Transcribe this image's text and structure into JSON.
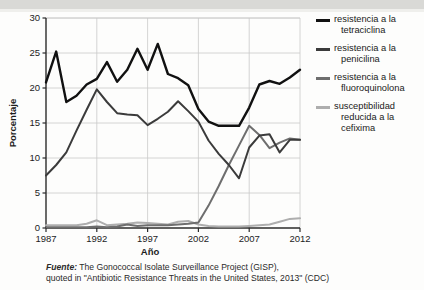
{
  "chart_data": {
    "type": "line",
    "title": "",
    "xlabel": "Año",
    "ylabel": "Porcentaje",
    "xlim": [
      1987,
      2012
    ],
    "ylim": [
      0,
      30
    ],
    "yticks": [
      0,
      5,
      10,
      15,
      20,
      25,
      30
    ],
    "xticks": [
      1987,
      1992,
      1997,
      2002,
      2007,
      2012
    ],
    "grid": true,
    "legend_position": "right",
    "x": [
      1987,
      1988,
      1989,
      1990,
      1991,
      1992,
      1993,
      1994,
      1995,
      1996,
      1997,
      1998,
      1999,
      2000,
      2001,
      2002,
      2003,
      2004,
      2005,
      2006,
      2007,
      2008,
      2009,
      2010,
      2011,
      2012
    ],
    "series": [
      {
        "name": "resistencia a la tetraciclina",
        "color": "#111111",
        "values": [
          20.8,
          25.2,
          18.0,
          18.9,
          20.5,
          21.3,
          23.7,
          20.9,
          22.6,
          25.6,
          22.6,
          26.3,
          22.0,
          21.4,
          20.4,
          17.0,
          15.2,
          14.6,
          14.6,
          14.6,
          17.2,
          20.5,
          21.0,
          20.6,
          21.5,
          22.6
        ]
      },
      {
        "name": "resistencia a la penicilina",
        "color": "#3b3b3b",
        "values": [
          7.5,
          9.0,
          10.8,
          13.9,
          16.9,
          19.8,
          18.0,
          16.4,
          16.2,
          16.1,
          14.7,
          15.6,
          16.6,
          18.1,
          16.7,
          15.2,
          12.5,
          10.6,
          9.0,
          7.1,
          11.5,
          13.2,
          13.4,
          10.8,
          12.6,
          12.6
        ]
      },
      {
        "name": "resistencia a la fluoroquinolona",
        "color": "#6e6e6e",
        "values": [
          0.1,
          0.1,
          0.1,
          0.1,
          0.1,
          0.2,
          0.1,
          0.2,
          0.5,
          0.3,
          0.4,
          0.4,
          0.4,
          0.5,
          0.6,
          0.8,
          3.2,
          6.0,
          9.0,
          11.8,
          14.6,
          13.3,
          11.4,
          12.2,
          12.8,
          12.6
        ]
      },
      {
        "name": "susceptibilidad reducida a la cefixima",
        "color": "#aeaeae",
        "values": [
          0.4,
          0.4,
          0.4,
          0.4,
          0.6,
          1.1,
          0.4,
          0.5,
          0.6,
          0.8,
          0.7,
          0.6,
          0.5,
          0.9,
          1.0,
          0.5,
          0.3,
          0.2,
          0.2,
          0.2,
          0.3,
          0.4,
          0.5,
          0.9,
          1.3,
          1.4
        ]
      }
    ]
  },
  "legend": [
    {
      "line1": "resistencia a la",
      "line2": "tetraciclina",
      "color": "#111111"
    },
    {
      "line1": "resistencia a la",
      "line2": "penicilina",
      "color": "#3b3b3b"
    },
    {
      "line1": "resistencia a la",
      "line2": "fluoroquinolona",
      "color": "#6e6e6e"
    },
    {
      "line1": "susceptibilidad",
      "line2": "reducida a la",
      "line3": "cefixima",
      "color": "#aeaeae"
    }
  ],
  "caption": {
    "source_word": "Fuente:",
    "line1": " The Gonococcal Isolate Surveillance Project (GISP),",
    "line2": "quoted in \"Antibiotic Resistance Threats in the United States, 2013\" (CDC)"
  }
}
